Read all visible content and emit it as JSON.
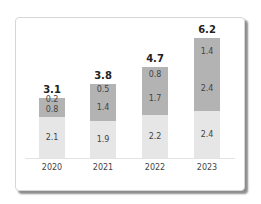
{
  "chart_data": {
    "type": "bar",
    "stacked": true,
    "title": "",
    "xlabel": "",
    "ylabel": "",
    "categories": [
      "2020",
      "2021",
      "2022",
      "2023"
    ],
    "series": [
      {
        "name": "bottom",
        "color": "#e6e6e6",
        "values": [
          2.1,
          1.9,
          2.2,
          2.4
        ]
      },
      {
        "name": "middle",
        "color": "#b3b3b3",
        "values": [
          0.8,
          1.4,
          1.7,
          2.4
        ]
      },
      {
        "name": "top",
        "color": "#b3b3b3",
        "values": [
          0.2,
          0.5,
          0.8,
          1.4
        ]
      }
    ],
    "totals": [
      3.1,
      3.8,
      4.7,
      6.2
    ],
    "ylim": [
      0,
      6.2
    ],
    "grid": false,
    "legend": "none"
  },
  "labels": {
    "totals": [
      "3.1",
      "3.8",
      "4.7",
      "6.2"
    ],
    "years": [
      "2020",
      "2021",
      "2022",
      "2023"
    ],
    "bottom": [
      "2.1",
      "1.9",
      "2.2",
      "2.4"
    ],
    "middle": [
      "0.8",
      "1.4",
      "1.7",
      "2.4"
    ],
    "top": [
      "0.2",
      "0.5",
      "0.8",
      "1.4"
    ]
  }
}
